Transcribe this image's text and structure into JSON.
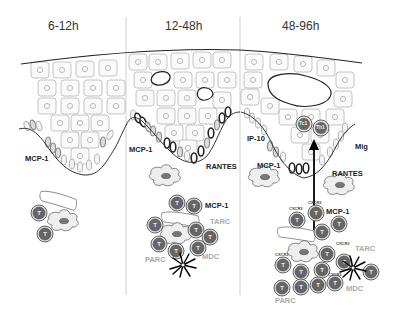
{
  "phases": [
    {
      "label": "6-12h"
    },
    {
      "label": "12-48h"
    },
    {
      "label": "48-96h"
    }
  ],
  "panel1": {
    "chemokines": [
      "MCP-1"
    ],
    "cell_label": "T"
  },
  "panel2": {
    "chemokines": [
      "MCP-1",
      "RANTES",
      "MCP-1",
      "TARC",
      "PARC",
      "MDC"
    ]
  },
  "panel3": {
    "chemokines": [
      "IP-10",
      "Mig",
      "MCP-1",
      "RANTES",
      "MCP-1",
      "TARC",
      "PARC",
      "MDC"
    ],
    "infiltrating_cells": [
      "Tc1",
      "Th1"
    ],
    "receptor": "CXCR3"
  },
  "colors": {
    "tcell_outer": "#888888",
    "tcell_inner": "#555555",
    "epithelium_stroke": "#aaaaaa",
    "grey_label": "#aaaaaa",
    "dark_label": "#222222",
    "divider": "#cccccc"
  }
}
